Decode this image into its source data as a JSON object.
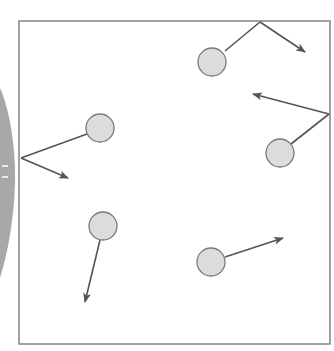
{
  "diagram": {
    "type": "bouncing-balls-in-box",
    "box": {
      "x1": 19,
      "y1": 21,
      "x2": 330,
      "y2": 344,
      "stroke": "#8a8a8a"
    },
    "ball_style": {
      "radius": 14,
      "fill": "#dcdcdc",
      "stroke": "#7a7a7a"
    },
    "arrow_color": "#555555",
    "side_shape": {
      "fill": "#a8a8a8"
    },
    "balls": [
      {
        "id": "ball-1",
        "center": [
          212,
          62
        ],
        "path": [
          [
            225,
            51
          ],
          [
            260,
            22
          ]
        ],
        "arrow": [
          [
            260,
            22
          ],
          [
            305,
            52
          ]
        ],
        "bounces_off": "top-wall"
      },
      {
        "id": "ball-2",
        "center": [
          280,
          153
        ],
        "path": [
          [
            291,
            144
          ],
          [
            329,
            114
          ]
        ],
        "arrow": [
          [
            329,
            114
          ],
          [
            253,
            94
          ]
        ],
        "bounces_off": "right-wall"
      },
      {
        "id": "ball-3",
        "center": [
          100,
          128
        ],
        "path": [
          [
            87,
            134
          ],
          [
            21,
            158
          ]
        ],
        "arrow": [
          [
            21,
            158
          ],
          [
            68,
            178
          ]
        ],
        "bounces_off": "left-wall"
      },
      {
        "id": "ball-4",
        "center": [
          103,
          226
        ],
        "path": [],
        "arrow": [
          [
            100,
            240
          ],
          [
            85,
            302
          ]
        ],
        "bounces_off": "none"
      },
      {
        "id": "ball-5",
        "center": [
          211,
          262
        ],
        "path": [],
        "arrow": [
          [
            225,
            257
          ],
          [
            283,
            238
          ]
        ],
        "bounces_off": "none"
      }
    ]
  }
}
